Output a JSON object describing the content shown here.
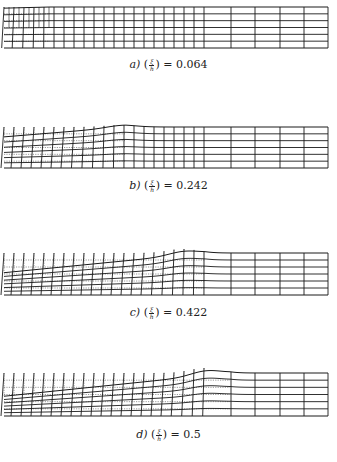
{
  "figure": {
    "panels": [
      {
        "id": "a",
        "label": "a)",
        "numerator": "ξ",
        "denominator": "h",
        "equals": "=",
        "value": "0.064",
        "box": {
          "x0": 4,
          "x1": 328,
          "top": 7,
          "bottom": 48
        },
        "bump": {
          "center": 40,
          "height": 0,
          "width": 30
        },
        "deform_front_x": 50,
        "caption_y": 66
      },
      {
        "id": "b",
        "label": "b)",
        "numerator": "ξ",
        "denominator": "h",
        "equals": "=",
        "value": "0.242",
        "box": {
          "x0": 4,
          "x1": 328,
          "top": 127,
          "bottom": 168
        },
        "bump": {
          "center": 120,
          "height": 2,
          "width": 30
        },
        "deform_front_x": 125,
        "caption_y": 187
      },
      {
        "id": "c",
        "label": "c)",
        "numerator": "ξ",
        "denominator": "h",
        "equals": "=",
        "value": "0.422",
        "box": {
          "x0": 4,
          "x1": 328,
          "top": 253,
          "bottom": 295
        },
        "bump": {
          "center": 183,
          "height": 4,
          "width": 30
        },
        "deform_front_x": 205,
        "caption_y": 314
      },
      {
        "id": "d",
        "label": "d)",
        "numerator": "ξ",
        "denominator": "h",
        "equals": "=",
        "value": "0.5",
        "box": {
          "x0": 4,
          "x1": 328,
          "top": 373,
          "bottom": 416
        },
        "bump": {
          "center": 205,
          "height": 5,
          "width": 30
        },
        "deform_front_x": 230,
        "caption_y": 436
      }
    ],
    "mesh": {
      "fine_columns_end_x": 208,
      "fine_column_spacing": 10,
      "coarse_column_xs": [
        231,
        255,
        280,
        304
      ],
      "rows": 6,
      "line_color": "#1a1a1a",
      "dotted_color": "#555555"
    }
  }
}
